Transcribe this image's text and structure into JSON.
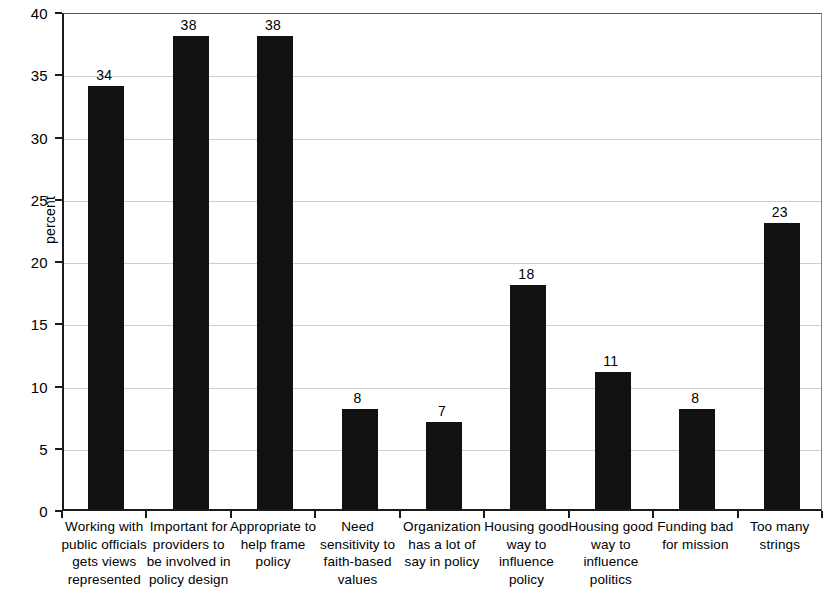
{
  "chart_data": {
    "type": "bar",
    "title": "",
    "subtitle": "",
    "xlabel": "",
    "ylabel": "percent",
    "ylim": [
      0,
      40
    ],
    "ytick_step": 5,
    "yticks": [
      "0",
      "5",
      "10",
      "15",
      "20",
      "25",
      "30",
      "35",
      "40"
    ],
    "grid": true,
    "grid_axis": "y",
    "legend": false,
    "legend_position": "none",
    "bar_color": "#111111",
    "categories": [
      "Working with public officials gets views represented",
      "Important for providers to be involved in policy design",
      "Appropriate to help frame policy",
      "Need sensitivity to faith-based values",
      "Organization has a lot of say in policy",
      "Housing good way to influence policy",
      "Housing good way to influence politics",
      "Funding bad for mission",
      "Too many strings"
    ],
    "category_lines": [
      [
        "Working with",
        "public officials",
        "gets views",
        "represented"
      ],
      [
        "Important for",
        "providers to",
        "be involved in",
        "policy design"
      ],
      [
        "Appropriate to",
        "help frame",
        "policy"
      ],
      [
        "Need",
        "sensitivity to",
        "faith-based",
        "values"
      ],
      [
        "Organization",
        "has a lot of",
        "say in policy"
      ],
      [
        "Housing good",
        "way to",
        "influence",
        "policy"
      ],
      [
        "Housing good",
        "way to",
        "influence",
        "politics"
      ],
      [
        "Funding bad",
        "for mission"
      ],
      [
        "Too many",
        "strings"
      ]
    ],
    "values": [
      34,
      38,
      38,
      8,
      7,
      18,
      11,
      8,
      23
    ],
    "value_labels": [
      "34",
      "38",
      "38",
      "8",
      "7",
      "18",
      "11",
      "8",
      "23"
    ]
  }
}
